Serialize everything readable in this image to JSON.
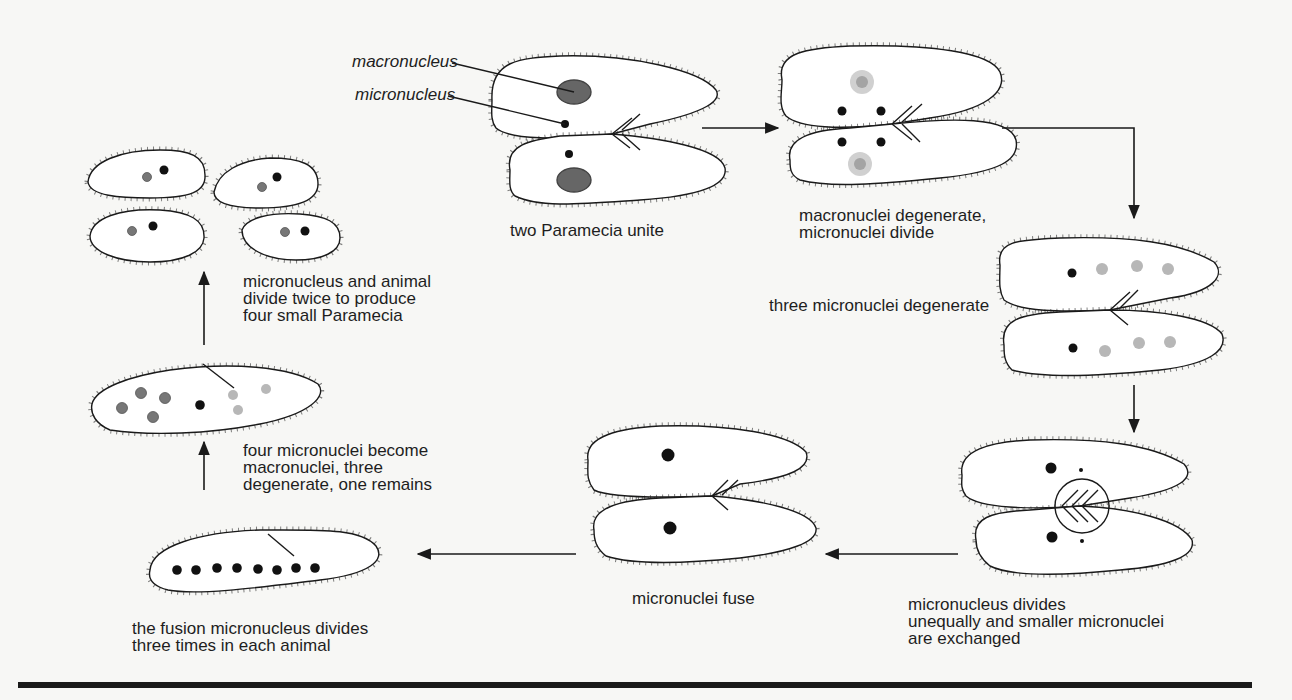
{
  "figure": {
    "colors": {
      "background": "#f7f7f5",
      "outline": "#1a1a1a",
      "cell_fill": "#ffffff",
      "macronucleus": "#666666",
      "micronucleus": "#111111",
      "new_macronucleus": "#777777",
      "bottom_rule": "#1a1a1a"
    },
    "labels": {
      "macronucleus": "macronucleus",
      "micronucleus": "micronucleus"
    },
    "stages": [
      {
        "id": 1,
        "caption": [
          "two Paramecia unite"
        ]
      },
      {
        "id": 2,
        "caption": [
          "macronuclei degenerate,",
          "micronuclei divide"
        ]
      },
      {
        "id": 3,
        "caption": [
          "three micronuclei degenerate"
        ]
      },
      {
        "id": 4,
        "caption": [
          "micronucleus divides",
          "unequally and smaller micronuclei",
          "are exchanged"
        ]
      },
      {
        "id": 5,
        "caption": [
          "micronuclei fuse"
        ]
      },
      {
        "id": 6,
        "caption": [
          "the fusion micronucleus divides",
          "three times in each animal"
        ]
      },
      {
        "id": 7,
        "caption": [
          "four micronuclei become",
          "macronuclei, three",
          "degenerate, one remains"
        ]
      },
      {
        "id": 8,
        "caption": [
          "micronucleus and animal",
          "divide twice to produce",
          "four small Paramecia"
        ]
      }
    ],
    "flow": [
      "1→2",
      "2→3",
      "3→4",
      "4→5",
      "5→6",
      "6→7",
      "7→8"
    ]
  }
}
